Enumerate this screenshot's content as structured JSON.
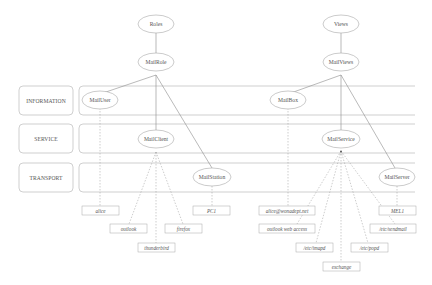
{
  "diagram": {
    "type": "layered-architecture-tree",
    "colors": {
      "stroke": "#a8a8a8",
      "line": "#8c8c8c",
      "text": "#555555",
      "background": "#ffffff"
    },
    "lanes": [
      {
        "id": "information",
        "label": "INFORMATION"
      },
      {
        "id": "service",
        "label": "SERVICE"
      },
      {
        "id": "transport",
        "label": "TRANSPORT"
      }
    ],
    "roots": [
      {
        "id": "roles",
        "label": "Roles"
      },
      {
        "id": "views",
        "label": "Views"
      }
    ],
    "nodes": {
      "mailrole": "MailRole",
      "mailviews": "MailViews",
      "mailuser": "MailUser",
      "mailbox": "MailBox",
      "mailclient": "MailClient",
      "mailservice": "MailService",
      "mailstation": "MailStation",
      "mailserver": "MailServer"
    },
    "leaves": {
      "alice": "alice",
      "outlook": "outlook",
      "thunderbird": "thunderbird",
      "firefox": "firefox",
      "pc1": "PC1",
      "alice_email": "alice@wonadept.net",
      "outlook_web_access": "outlook web access",
      "imapd": "/etc/imapd",
      "exchange": "exchange",
      "popd": "/etc/popd",
      "mel1": "MEL1",
      "sendmail": "/etc/sendmail"
    }
  }
}
